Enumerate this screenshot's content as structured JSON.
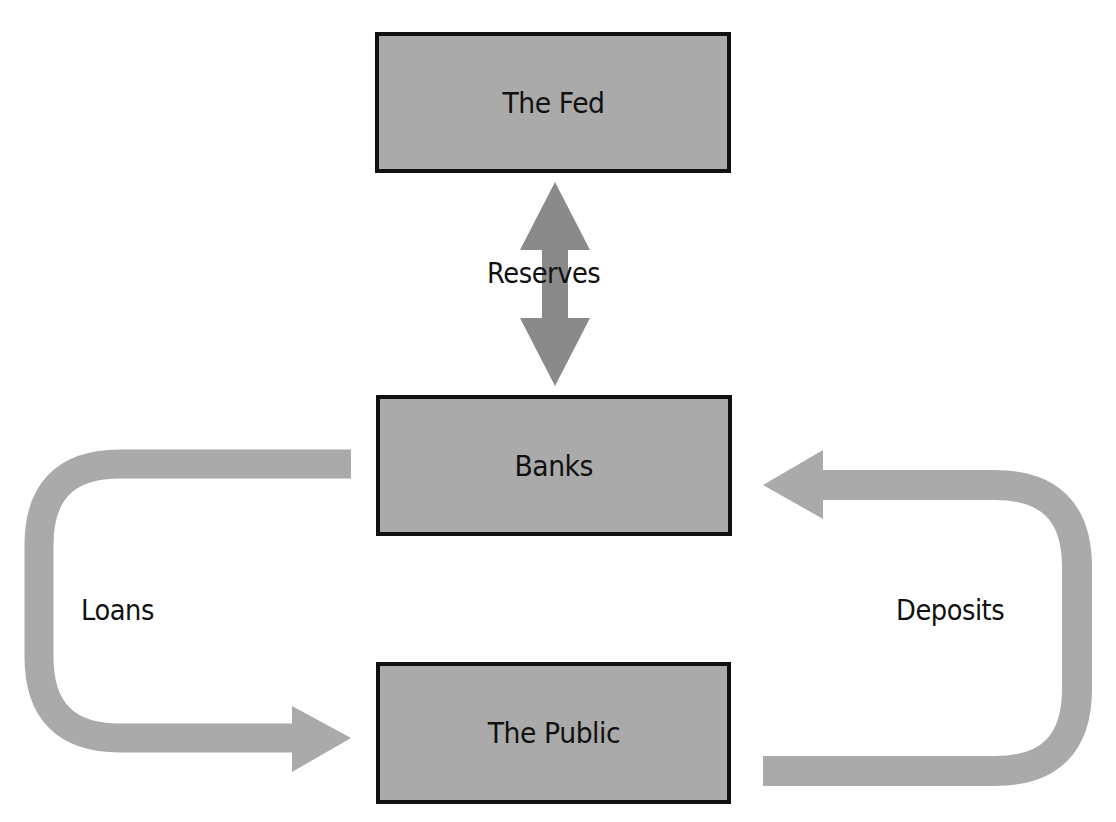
{
  "diagram": {
    "type": "flow",
    "colors": {
      "node_fill": "#aaaaaa",
      "node_border": "#111111",
      "reserves_arrow": "#8a8a8a",
      "flow_arrow": "#aaaaaa",
      "text": "#111111",
      "background": "#ffffff"
    },
    "nodes": [
      {
        "id": "fed",
        "label": "The Fed"
      },
      {
        "id": "banks",
        "label": "Banks"
      },
      {
        "id": "public",
        "label": "The Public"
      }
    ],
    "edges": [
      {
        "id": "reserves",
        "label": "Reserves",
        "from": "fed",
        "to": "banks",
        "direction": "bidirectional"
      },
      {
        "id": "loans",
        "label": "Loans",
        "from": "banks",
        "to": "public",
        "direction": "forward"
      },
      {
        "id": "deposits",
        "label": "Deposits",
        "from": "public",
        "to": "banks",
        "direction": "forward"
      }
    ]
  }
}
